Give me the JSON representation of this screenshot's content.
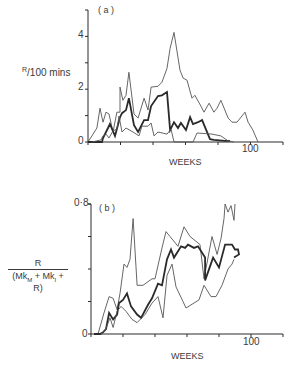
{
  "chart_data": [
    {
      "type": "line",
      "panel_label": "( a )",
      "title": "",
      "xlabel": "WEEKS",
      "ylabel": "R/100 mins",
      "xlim": [
        0,
        120
      ],
      "ylim": [
        0,
        5
      ],
      "x_ticks": [
        0,
        20,
        40,
        60,
        80,
        100,
        120
      ],
      "x_tick_labels": {
        "100": "100"
      },
      "y_ticks": [
        0,
        1,
        2,
        3,
        4
      ],
      "y_tick_labels": {
        "0": "0",
        "2": "2",
        "4": "4"
      },
      "grid": false,
      "series": [
        {
          "name": "upper",
          "style": "thin",
          "x": [
            0,
            5.5,
            7.4,
            9.2,
            11.1,
            12.9,
            15.4,
            17.8,
            19.7,
            19.7,
            21.5,
            23.4,
            25.2,
            28.3,
            30.8,
            34.5,
            36.9,
            38.8,
            43.1,
            45.5,
            48.6,
            50.5,
            52.9,
            56.6,
            58.5,
            60.9,
            64,
            65.8,
            69.5,
            71.4,
            74.5,
            77.5,
            79.4,
            81.8,
            86.2,
            88.6,
            91.7,
            96.6,
            98.5,
            101.5,
            104.6
          ],
          "y": [
            0,
            0.53,
            1.28,
            0.75,
            1.13,
            1.06,
            0.38,
            1.13,
            1.13,
            2.08,
            1.58,
            1.77,
            2.64,
            1.06,
            0.91,
            1.66,
            1.21,
            2.08,
            2.11,
            2.26,
            2.79,
            3.55,
            4.15,
            2.72,
            2.42,
            2.34,
            1.66,
            1.77,
            1.36,
            1.13,
            1.47,
            1.13,
            1.28,
            1.58,
            0.91,
            0.75,
            0.75,
            1.13,
            0.75,
            0.45,
            0
          ]
        },
        {
          "name": "middle",
          "style": "thick",
          "x": [
            0,
            8.6,
            9.2,
            12.3,
            13.5,
            16.6,
            19.7,
            20.9,
            23.4,
            25.2,
            28.3,
            30.8,
            34.5,
            36.9,
            38.8,
            43.1,
            45.5,
            48.6,
            50.5,
            52.9,
            55.4,
            57.2,
            60.3,
            62.8,
            64.6,
            67.7,
            70.2,
            75.1,
            77.5,
            84.3,
            87.4
          ],
          "y": [
            0,
            0,
            0.15,
            0.53,
            0.68,
            0.23,
            0.94,
            1.09,
            1.21,
            1.66,
            0.64,
            0.38,
            0.83,
            0.83,
            1.36,
            1.74,
            1.77,
            1.89,
            0.45,
            0.75,
            0.53,
            0.72,
            0.45,
            0.94,
            0.68,
            0.75,
            0.83,
            0.11,
            0.08,
            0.04,
            0.04
          ]
        },
        {
          "name": "lower",
          "style": "thin",
          "x": [
            2.5,
            8,
            9.2,
            11.1,
            12.9,
            15.4,
            17.8,
            19.1,
            20.9,
            23.4,
            27.7,
            31.4,
            33.2,
            36.9,
            38.8,
            40.6,
            43.1,
            48.6,
            51.1,
            52.9,
            64.6,
            67.1,
            76.3,
            81.8,
            86.2,
            89.8
          ],
          "y": [
            0,
            0.08,
            0.23,
            0.3,
            0.15,
            0.42,
            0.49,
            0.98,
            0.38,
            0.53,
            0.38,
            0.23,
            0.6,
            0.6,
            0.72,
            0.23,
            0.38,
            0.3,
            0.49,
            0,
            0,
            0.34,
            0.3,
            0.23,
            0.04,
            0
          ]
        }
      ]
    },
    {
      "type": "line",
      "panel_label": "( b )",
      "title": "",
      "xlabel": "WEEKS",
      "ylabel": "R / (Mk_M + Mk_I + R)",
      "xlim": [
        0,
        120
      ],
      "ylim": [
        0,
        0.8
      ],
      "x_ticks": [
        0,
        20,
        40,
        60,
        80,
        100,
        120
      ],
      "x_tick_labels": {
        "100": "100"
      },
      "y_ticks": [
        0,
        0.2,
        0.4,
        0.6,
        0.8
      ],
      "y_tick_labels": {
        "0": "0",
        "0.8": "0·8"
      },
      "grid": false,
      "series": [
        {
          "name": "upper",
          "style": "thin",
          "x": [
            4.4,
            8.1,
            11.3,
            13.8,
            16.3,
            18.1,
            20.6,
            22.5,
            24.4,
            26.3,
            28.8,
            32.5,
            38.1,
            40,
            44.4,
            46.9,
            49.4,
            54.4,
            58.1,
            61.9,
            68.1,
            70.6,
            75.6,
            78.8,
            81.3,
            83.1,
            83.8,
            85.6,
            87.5,
            89.4,
            90
          ],
          "y": [
            0,
            0.13,
            0.23,
            0.22,
            0.15,
            0.25,
            0.43,
            0.41,
            0.46,
            0.71,
            0.3,
            0.3,
            0.34,
            0.34,
            0.53,
            0.63,
            0.6,
            0.54,
            0.66,
            0.6,
            0.55,
            0.34,
            0.6,
            0.49,
            0.59,
            0.71,
            0.8,
            0.75,
            0.79,
            0.7,
            0.8
          ]
        },
        {
          "name": "middle",
          "style": "thick",
          "x": [
            1.9,
            5.6,
            7.5,
            9.4,
            11.3,
            13.8,
            16.3,
            17.5,
            20,
            22.5,
            25,
            28.8,
            31.3,
            35.6,
            38.1,
            41.9,
            44.4,
            47.5,
            50,
            51.9,
            56.3,
            58.8,
            60.6,
            64.4,
            66.9,
            71.3,
            71.3,
            76.3,
            80,
            83.8,
            86.3,
            88.1,
            90,
            91.9,
            92.5,
            89.4
          ],
          "y": [
            0,
            0,
            0.01,
            0.03,
            0.13,
            0.09,
            0.12,
            0.19,
            0.21,
            0.25,
            0.17,
            0.12,
            0.1,
            0.18,
            0.22,
            0.31,
            0.3,
            0.46,
            0.52,
            0.47,
            0.54,
            0.53,
            0.55,
            0.53,
            0.54,
            0.47,
            0.33,
            0.47,
            0.41,
            0.55,
            0.55,
            0.55,
            0.52,
            0.52,
            0.49,
            0.47
          ]
        },
        {
          "name": "lower",
          "style": "thin",
          "x": [
            6.3,
            8.8,
            11.9,
            13.8,
            16.3,
            18.8,
            21.9,
            25.6,
            28.8,
            33.8,
            38.1,
            41.9,
            45,
            47.5,
            50.6,
            53.1,
            57.5,
            59.4,
            67.5,
            70.6,
            75,
            78.1,
            81.9,
            85.6,
            88.1,
            89.4
          ],
          "y": [
            0,
            0.02,
            0.1,
            0.04,
            0.14,
            0.17,
            0.14,
            0.09,
            0.07,
            0.12,
            0.19,
            0.23,
            0.1,
            0.36,
            0.43,
            0.29,
            0.2,
            0.16,
            0.21,
            0.3,
            0.23,
            0.23,
            0.3,
            0.4,
            0.43,
            0.46
          ]
        }
      ]
    }
  ],
  "labels": {
    "a": {
      "panel": "( a )",
      "ylabel": "R/100 mins",
      "ylabel_sup": "R",
      "ylabel_rest": "/100 mins",
      "xlabel": "WEEKS",
      "tick_y_0": "0",
      "tick_y_2": "2",
      "tick_y_4": "4",
      "tick_x_100": "100"
    },
    "b": {
      "panel": "( b )",
      "ylabel_num": "R",
      "ylabel_den_1": "(Mk",
      "ylabel_den_sub_1": "M",
      "ylabel_den_2": " + Mk",
      "ylabel_den_sub_2": "I",
      "ylabel_den_3": " + R)",
      "xlabel": "WEEKS",
      "tick_y_0": "0",
      "tick_y_08": "0·8",
      "tick_x_100": "100"
    }
  },
  "colors": {
    "ink": "#2a2a2a",
    "thin_line": "#555555",
    "background": "#ffffff"
  }
}
